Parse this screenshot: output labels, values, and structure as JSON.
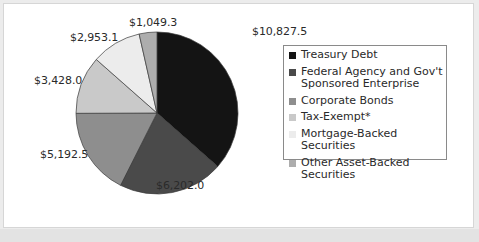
{
  "chart_data": {
    "type": "pie",
    "title": "",
    "categories": [
      "Treasury Debt",
      "Federal Agency and Gov't Sponsored Enterprise",
      "Corporate Bonds",
      "Tax-Exempt*",
      "Mortgage-Backed Securities",
      "Other Asset-Backed Securities"
    ],
    "values": [
      10827.5,
      6202.0,
      5192.5,
      3428.0,
      2953.1,
      1049.3
    ],
    "labels": [
      "$10,827.5",
      "$6,202.0",
      "$5,192.5",
      "$3,428.0",
      "$2,953.1",
      "$1,049.3"
    ],
    "colors": [
      "#141414",
      "#4a4a4a",
      "#8e8e8e",
      "#c9c9c9",
      "#ececec",
      "#adadad"
    ],
    "start_angle": "12 o'clock",
    "direction": "clockwise",
    "legend_position": "right"
  },
  "legend": {
    "items": [
      {
        "label_line1": "Treasury Debt",
        "label_line2": "",
        "color": "#141414"
      },
      {
        "label_line1": "Federal Agency and Gov't",
        "label_line2": "Sponsored Enterprise",
        "color": "#4a4a4a"
      },
      {
        "label_line1": "Corporate Bonds",
        "label_line2": "",
        "color": "#8e8e8e"
      },
      {
        "label_line1": "Tax-Exempt*",
        "label_line2": "",
        "color": "#c9c9c9"
      },
      {
        "label_line1": "Mortgage-Backed Securities",
        "label_line2": "",
        "color": "#ececec"
      },
      {
        "label_line1": "Other Asset-Backed Securities",
        "label_line2": "",
        "color": "#adadad"
      }
    ]
  },
  "slice_labels": {
    "treasury": "$10,827.5",
    "federal": "$6,202.0",
    "corporate": "$5,192.5",
    "tax_exempt": "$3,428.0",
    "mortgage": "$2,953.1",
    "other": "$1,049.3"
  }
}
